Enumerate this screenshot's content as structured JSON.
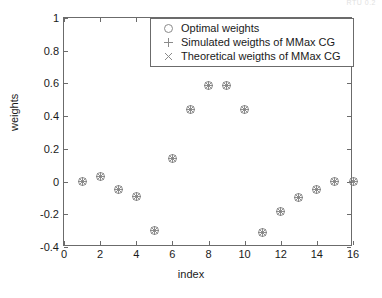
{
  "top_artifact": "RTU  0.2",
  "axes": {
    "xlabel": "index",
    "ylabel": "weights",
    "xticks": [
      "0",
      "2",
      "4",
      "6",
      "8",
      "10",
      "12",
      "14",
      "16"
    ],
    "yticks": [
      "1",
      "0.8",
      "0.6",
      "0.4",
      "0.2",
      "0",
      "-0.2",
      "-0.4"
    ]
  },
  "legend": {
    "entries": [
      {
        "marker": "circle-marker",
        "label": "Optimal weights"
      },
      {
        "marker": "plus-marker",
        "label": "Simulated weigths of MMax CG"
      },
      {
        "marker": "times-marker",
        "label": "Theoretical weigths of MMax CG"
      }
    ]
  },
  "colors": {
    "axis": "#6b6b6b",
    "marker": "#808080",
    "text": "#1a1a1a",
    "background": "#ffffff"
  },
  "chart_data": {
    "type": "scatter",
    "title": "",
    "xlabel": "index",
    "ylabel": "weights",
    "xlim": [
      0,
      16
    ],
    "ylim": [
      -0.4,
      1
    ],
    "xticks": [
      0,
      2,
      4,
      6,
      8,
      10,
      12,
      14,
      16
    ],
    "yticks": [
      -0.4,
      -0.2,
      0,
      0.2,
      0.4,
      0.6,
      0.8,
      1
    ],
    "grid": false,
    "legend_position": "upper center-right",
    "x": [
      1,
      2,
      3,
      4,
      5,
      6,
      7,
      8,
      9,
      10,
      11,
      12,
      13,
      14,
      15,
      16
    ],
    "series": [
      {
        "name": "Optimal weights",
        "marker": "o",
        "values": [
          0.0,
          0.03,
          -0.05,
          -0.09,
          -0.3,
          0.14,
          0.44,
          0.59,
          0.59,
          0.44,
          -0.31,
          -0.18,
          -0.1,
          -0.05,
          0.0,
          0.0
        ]
      },
      {
        "name": "Simulated weigths of MMax CG",
        "marker": "+",
        "values": [
          0.0,
          0.03,
          -0.05,
          -0.09,
          -0.3,
          0.14,
          0.44,
          0.59,
          0.59,
          0.44,
          -0.31,
          -0.18,
          -0.1,
          -0.05,
          0.0,
          0.0
        ]
      },
      {
        "name": "Theoretical weigths of MMax CG",
        "marker": "x",
        "values": [
          0.0,
          0.03,
          -0.05,
          -0.09,
          -0.3,
          0.14,
          0.44,
          0.59,
          0.59,
          0.44,
          -0.31,
          -0.18,
          -0.1,
          -0.05,
          0.0,
          0.0
        ]
      }
    ]
  }
}
